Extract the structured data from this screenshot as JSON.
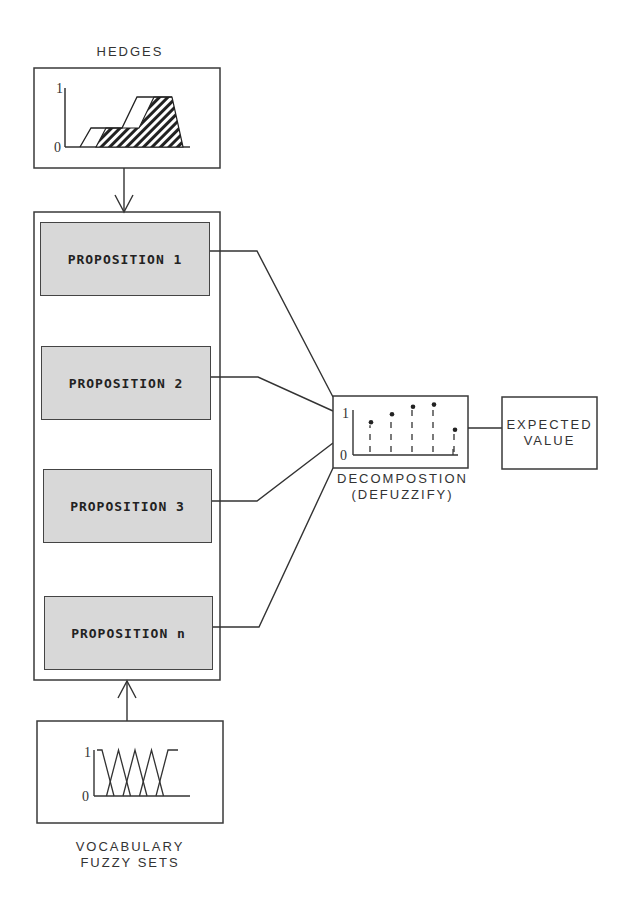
{
  "diagram": {
    "hedges": {
      "label": "HEDGES",
      "y_top_label": "1",
      "y_bottom_label": "0"
    },
    "propositions": [
      {
        "label": "PROPOSITION 1"
      },
      {
        "label": "PROPOSITION 2"
      },
      {
        "label": "PROPOSITION 3"
      },
      {
        "label": "PROPOSITION n"
      }
    ],
    "decomposition": {
      "label_line1": "DECOMPOSTION",
      "label_line2": "(DEFUZZIFY)",
      "y_top_label": "1",
      "y_bottom_label": "0",
      "spikes": [
        0.78,
        0.97,
        1.15,
        1.2,
        0.6
      ]
    },
    "expected_value": {
      "label_line1": "EXPECTED",
      "label_line2": "VALUE"
    },
    "vocabulary": {
      "label_line1": "VOCABULARY",
      "label_line2": "FUZZY SETS",
      "y_top_label": "1",
      "y_bottom_label": "0",
      "set_count": 5
    },
    "colors": {
      "line": "#3a3a3a",
      "proposition_fill": "#d8d8d8"
    }
  }
}
